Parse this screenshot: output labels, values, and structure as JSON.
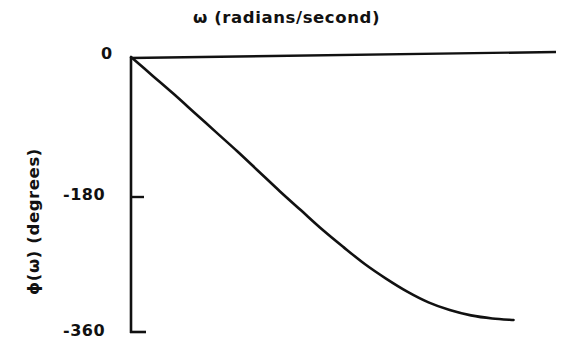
{
  "figure": {
    "background_color": "#ffffff",
    "ink_color": "#111111"
  },
  "chart_data": {
    "type": "line",
    "title": "ω (radians/second)",
    "xlabel": "ω (radians/second)",
    "ylabel": "ϕ(ω)  (degrees)",
    "subtitle": "",
    "grid": false,
    "legend": null,
    "legend_position": "none",
    "xlim": [
      0,
      1
    ],
    "ylim": [
      -360,
      0
    ],
    "x_tick_labels": [],
    "y_tick_labels": [
      "0",
      "-180",
      "-360"
    ],
    "y_ticks": [
      0,
      -180,
      -360
    ],
    "annotations": [],
    "series": [
      {
        "name": "phase",
        "x": [
          0.0,
          0.05,
          0.1,
          0.15,
          0.2,
          0.25,
          0.3,
          0.35,
          0.4,
          0.45,
          0.5,
          0.55,
          0.6,
          0.65,
          0.7,
          0.75,
          0.8,
          0.85,
          0.9
        ],
        "values": [
          0,
          -24,
          -48,
          -73,
          -98,
          -123,
          -149,
          -175,
          -200,
          -225,
          -248,
          -270,
          -289,
          -306,
          -320,
          -330,
          -337,
          -341,
          -343
        ]
      }
    ]
  },
  "labels": {
    "title": "ω (radians/second)",
    "ylabel": "ϕ(ω)  (degrees)",
    "tick_0": "0",
    "tick_180": "-180",
    "tick_360": "-360"
  }
}
